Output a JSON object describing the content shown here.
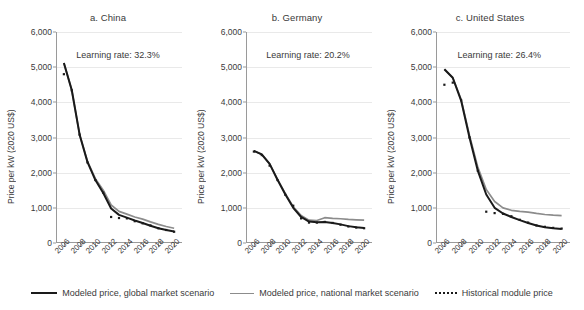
{
  "figure": {
    "ylabel": "Price per kW (2020 US$)"
  },
  "legend": {
    "items": [
      {
        "label": "Modeled price, global market scenario",
        "key": "global",
        "color": "#1a1a1a",
        "style": "solid"
      },
      {
        "label": "Modeled price, national market scenario",
        "key": "national",
        "color": "#8c8c8c",
        "style": "solid"
      },
      {
        "label": "Historical module price",
        "key": "historical",
        "color": "#1a1a1a",
        "style": "dotted"
      }
    ]
  },
  "chart_data": [
    {
      "type": "line",
      "title": "a. China",
      "annotation": "Learning rate: 32.3%",
      "xlabel": "",
      "ylabel": "Price per kW (2020 US$)",
      "xlim": [
        2005,
        2021
      ],
      "ylim": [
        0,
        6000
      ],
      "yticks": [
        0,
        1000,
        2000,
        3000,
        4000,
        5000,
        6000
      ],
      "ytick_labels": [
        "0",
        "1,000",
        "2,000",
        "3,000",
        "4,000",
        "5,000",
        "6,000"
      ],
      "xticks": [
        2006,
        2008,
        2010,
        2012,
        2014,
        2016,
        2018,
        2020
      ],
      "xtick_labels": [
        "2006",
        "2008",
        "2010",
        "2012",
        "2014",
        "2016",
        "2018",
        "2020"
      ],
      "grid": true,
      "legend_position": "bottom",
      "x": [
        2006,
        2007,
        2008,
        2009,
        2010,
        2011,
        2012,
        2013,
        2014,
        2015,
        2016,
        2017,
        2018,
        2019,
        2020
      ],
      "series": [
        {
          "name": "Modeled price, global market scenario",
          "values": [
            5120,
            4350,
            3080,
            2300,
            1790,
            1420,
            980,
            800,
            720,
            640,
            570,
            490,
            420,
            370,
            330
          ]
        },
        {
          "name": "Modeled price, national market scenario",
          "values": [
            5120,
            4350,
            3080,
            2320,
            1830,
            1500,
            1080,
            900,
            820,
            740,
            680,
            600,
            530,
            470,
            420
          ]
        },
        {
          "name": "Historical module price",
          "values": [
            4800,
            4340,
            3080,
            2290,
            1790,
            1430,
            740,
            710,
            700,
            620,
            560,
            500,
            420,
            370,
            320
          ]
        }
      ]
    },
    {
      "type": "line",
      "title": "b. Germany",
      "annotation": "Learning rate: 20.2%",
      "xlabel": "",
      "ylabel": "Price per kW (2020 US$)",
      "xlim": [
        2005,
        2021
      ],
      "ylim": [
        0,
        6000
      ],
      "yticks": [
        0,
        1000,
        2000,
        3000,
        4000,
        5000,
        6000
      ],
      "ytick_labels": [
        "0",
        "1,000",
        "2,000",
        "3,000",
        "4,000",
        "5,000",
        "6,000"
      ],
      "xticks": [
        2006,
        2008,
        2010,
        2012,
        2014,
        2016,
        2018,
        2020
      ],
      "xtick_labels": [
        "2006",
        "2008",
        "2010",
        "2012",
        "2014",
        "2016",
        "2018",
        "2020"
      ],
      "grid": true,
      "legend_position": "bottom",
      "x": [
        2006,
        2007,
        2008,
        2009,
        2010,
        2011,
        2012,
        2013,
        2014,
        2015,
        2016,
        2017,
        2018,
        2019,
        2020
      ],
      "series": [
        {
          "name": "Modeled price, global market scenario",
          "values": [
            2620,
            2520,
            2250,
            1800,
            1380,
            1000,
            740,
            610,
            590,
            600,
            570,
            530,
            480,
            450,
            430
          ]
        },
        {
          "name": "Modeled price, national market scenario",
          "values": [
            2620,
            2520,
            2250,
            1810,
            1400,
            1030,
            780,
            650,
            640,
            720,
            700,
            690,
            670,
            660,
            650
          ]
        },
        {
          "name": "Historical module price",
          "values": [
            2600,
            2500,
            2200,
            1790,
            1370,
            1060,
            700,
            580,
            580,
            600,
            570,
            520,
            470,
            440,
            420
          ]
        }
      ]
    },
    {
      "type": "line",
      "title": "c. United States",
      "annotation": "Learning rate: 26.4%",
      "xlabel": "",
      "ylabel": "Price per kW (2020 US$)",
      "xlim": [
        2005,
        2021
      ],
      "ylim": [
        0,
        6000
      ],
      "yticks": [
        0,
        1000,
        2000,
        3000,
        4000,
        5000,
        6000
      ],
      "ytick_labels": [
        "0",
        "1,000",
        "2,000",
        "3,000",
        "4,000",
        "5,000",
        "6,000"
      ],
      "xticks": [
        2006,
        2008,
        2010,
        2012,
        2014,
        2016,
        2018,
        2020
      ],
      "xtick_labels": [
        "2006",
        "2008",
        "2010",
        "2012",
        "2014",
        "2016",
        "2018",
        "2020"
      ],
      "grid": true,
      "legend_position": "bottom",
      "x": [
        2006,
        2007,
        2008,
        2009,
        2010,
        2011,
        2012,
        2013,
        2014,
        2015,
        2016,
        2017,
        2018,
        2019,
        2020
      ],
      "series": [
        {
          "name": "Modeled price, global market scenario",
          "values": [
            4940,
            4700,
            4050,
            3000,
            2050,
            1380,
            1000,
            840,
            740,
            650,
            570,
            500,
            450,
            420,
            400
          ]
        },
        {
          "name": "Modeled price, national market scenario",
          "values": [
            4940,
            4700,
            4080,
            3060,
            2150,
            1520,
            1180,
            1000,
            930,
            900,
            880,
            840,
            810,
            790,
            780
          ]
        },
        {
          "name": "Historical module price",
          "values": [
            4500,
            4560,
            4060,
            3000,
            2050,
            890,
            850,
            830,
            760,
            660,
            580,
            500,
            460,
            430,
            410
          ]
        }
      ]
    }
  ]
}
